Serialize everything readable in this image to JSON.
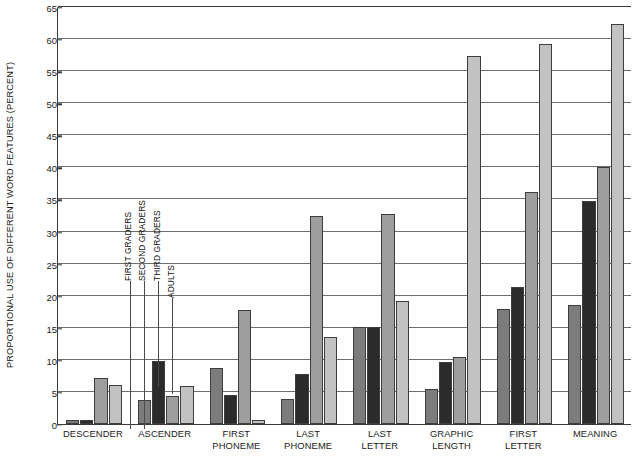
{
  "chart_data": {
    "type": "bar",
    "title": "",
    "xlabel": "",
    "ylabel": "PROPORTIONAL USE OF DIFFERENT WORD FEATURES (PERCENT)",
    "ylim": [
      0,
      65
    ],
    "ytick_step": 5,
    "yticks": [
      0,
      5,
      10,
      15,
      20,
      25,
      30,
      35,
      40,
      45,
      50,
      55,
      60,
      65
    ],
    "grid": true,
    "legend_position": "inline-callout-first-group",
    "categories": [
      "DESCENDER",
      "ASCENDER",
      "FIRST PHONEME",
      "LAST PHONEME",
      "LAST LETTER",
      "GRAPHIC LENGTH",
      "FIRST LETTER",
      "MEANING"
    ],
    "category_lines": [
      [
        "DESCENDER"
      ],
      [
        "ASCENDER"
      ],
      [
        "FIRST",
        "PHONEME"
      ],
      [
        "LAST",
        "PHONEME"
      ],
      [
        "LAST",
        "LETTER"
      ],
      [
        "GRAPHIC",
        "LENGTH"
      ],
      [
        "FIRST",
        "LETTER"
      ],
      [
        "MEANING"
      ]
    ],
    "series": [
      {
        "name": "FIRST GRADERS",
        "color": "#7c7c7c",
        "values": [
          0.6,
          3.8,
          8.7,
          3.9,
          15.1,
          5.5,
          18.0,
          18.5
        ]
      },
      {
        "name": "SECOND GRADERS",
        "color": "#2b2b2b",
        "values": [
          0.6,
          9.9,
          4.6,
          7.8,
          15.1,
          9.6,
          21.3,
          34.7
        ]
      },
      {
        "name": "THIRD GRADERS",
        "color": "#9e9e9e",
        "values": [
          7.2,
          4.3,
          17.7,
          32.4,
          32.8,
          10.4,
          36.2,
          40.1
        ]
      },
      {
        "name": "ADULTS",
        "color": "#c2c2c2",
        "values": [
          6.1,
          6.0,
          0.6,
          13.6,
          19.1,
          57.3,
          59.3,
          62.4
        ]
      }
    ]
  },
  "colors": {
    "axis": "#3a3a3a",
    "gridline": "#6e6e6e",
    "text": "#1a1a1a",
    "background": "#ffffff",
    "bar_outline": "#3d3d3d"
  }
}
